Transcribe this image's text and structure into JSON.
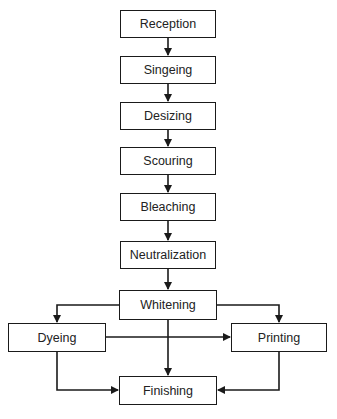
{
  "diagram": {
    "type": "process-flowchart",
    "nodes": [
      {
        "id": "reception",
        "label": "Reception"
      },
      {
        "id": "singeing",
        "label": "Singeing"
      },
      {
        "id": "desizing",
        "label": "Desizing"
      },
      {
        "id": "scouring",
        "label": "Scouring"
      },
      {
        "id": "bleaching",
        "label": "Bleaching"
      },
      {
        "id": "neutralization",
        "label": "Neutralization"
      },
      {
        "id": "whitening",
        "label": "Whitening"
      },
      {
        "id": "dyeing",
        "label": "Dyeing"
      },
      {
        "id": "printing",
        "label": "Printing"
      },
      {
        "id": "finishing",
        "label": "Finishing"
      }
    ],
    "edges": [
      {
        "from": "reception",
        "to": "singeing"
      },
      {
        "from": "singeing",
        "to": "desizing"
      },
      {
        "from": "desizing",
        "to": "scouring"
      },
      {
        "from": "scouring",
        "to": "bleaching"
      },
      {
        "from": "bleaching",
        "to": "neutralization"
      },
      {
        "from": "neutralization",
        "to": "whitening"
      },
      {
        "from": "whitening",
        "to": "dyeing"
      },
      {
        "from": "whitening",
        "to": "printing"
      },
      {
        "from": "whitening",
        "to": "finishing"
      },
      {
        "from": "dyeing",
        "to": "printing"
      },
      {
        "from": "dyeing",
        "to": "finishing"
      },
      {
        "from": "printing",
        "to": "finishing"
      }
    ],
    "colors": {
      "stroke": "#1a1a1a",
      "background": "#ffffff",
      "text": "#222222"
    }
  }
}
